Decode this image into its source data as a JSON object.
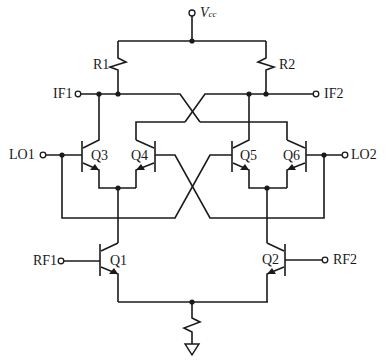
{
  "diagram": {
    "type": "circuit-schematic",
    "colors": {
      "line": "#1a1a1a",
      "background": "#ffffff"
    },
    "supply": {
      "label_main": "V",
      "label_sub": "cc"
    },
    "resistors": [
      {
        "id": "R1",
        "label": "R1"
      },
      {
        "id": "R2",
        "label": "R2"
      },
      {
        "id": "Rtail",
        "label": ""
      }
    ],
    "ports": {
      "if1": "IF1",
      "if2": "IF2",
      "lo1": "LO1",
      "lo2": "LO2",
      "rf1": "RF1",
      "rf2": "RF2"
    },
    "transistors": [
      {
        "id": "Q1",
        "label": "Q1"
      },
      {
        "id": "Q2",
        "label": "Q2"
      },
      {
        "id": "Q3",
        "label": "Q3"
      },
      {
        "id": "Q4",
        "label": "Q4"
      },
      {
        "id": "Q5",
        "label": "Q5"
      },
      {
        "id": "Q6",
        "label": "Q6"
      }
    ],
    "ground": "ground-symbol"
  }
}
